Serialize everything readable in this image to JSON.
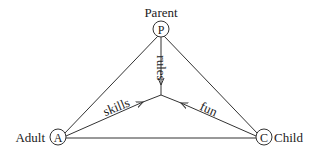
{
  "diagram": {
    "type": "triangle-relationship",
    "nodes": [
      {
        "id": "P",
        "letter": "P",
        "label": "Parent"
      },
      {
        "id": "A",
        "letter": "A",
        "label": "Adult"
      },
      {
        "id": "C",
        "letter": "C",
        "label": "Child"
      }
    ],
    "edges": [
      {
        "from": "P",
        "to": "A"
      },
      {
        "from": "P",
        "to": "C"
      },
      {
        "from": "A",
        "to": "C"
      }
    ],
    "arrows_to_center": [
      {
        "from": "P",
        "label": "rules"
      },
      {
        "from": "A",
        "label": "skills"
      },
      {
        "from": "C",
        "label": "fun"
      }
    ],
    "colors": {
      "line": "#333333",
      "text": "#222222",
      "background": "#ffffff"
    }
  }
}
